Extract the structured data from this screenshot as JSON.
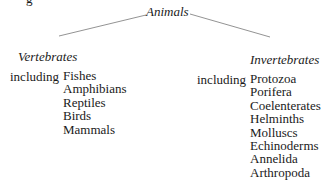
{
  "fragment": "g",
  "root": "Animals",
  "branches": [
    {
      "title": "Vertebrates",
      "connector": "including",
      "items": [
        "Fishes",
        "Amphibians",
        "Reptiles",
        "Birds",
        "Mammals"
      ]
    },
    {
      "title": "Invertebrates",
      "connector": "including",
      "items": [
        "Protozoa",
        "Porifera",
        "Coelenterates",
        "Helminths",
        "Molluscs",
        "Echinoderms",
        "Annelida",
        "Arthropoda"
      ]
    }
  ]
}
